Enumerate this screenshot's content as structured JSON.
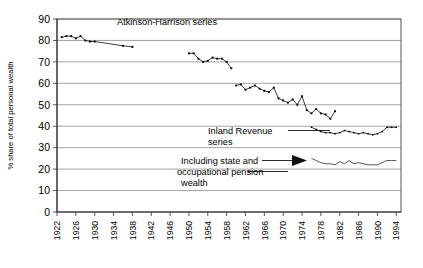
{
  "chart_data": {
    "type": "line",
    "title": "",
    "xlabel": "",
    "ylabel": "% share of total personal wealth",
    "ylim": [
      0,
      90
    ],
    "ytick_step": 10,
    "yticks": [
      0,
      10,
      20,
      30,
      40,
      50,
      60,
      70,
      80,
      90
    ],
    "xlim": [
      1922,
      1995
    ],
    "xticks": [
      1922,
      1926,
      1930,
      1934,
      1938,
      1942,
      1946,
      1950,
      1954,
      1958,
      1962,
      1966,
      1970,
      1974,
      1978,
      1982,
      1986,
      1990,
      1994
    ],
    "grid": "horizontal",
    "legend": "annotations-inline",
    "annotations": [
      {
        "name": "atkinson-harrison-label",
        "text": "Atkinson-Harrison series"
      },
      {
        "name": "inland-revenue-label-line1",
        "text": "Inland Revenue"
      },
      {
        "name": "inland-revenue-label-line2",
        "text": "series"
      },
      {
        "name": "pension-label-line1",
        "text": "Including state and"
      },
      {
        "name": "pension-label-line2",
        "text": "occupational pension"
      },
      {
        "name": "pension-label-line3",
        "text": "wealth"
      }
    ],
    "series": [
      {
        "name": "Atkinson-Harrison series",
        "marker": "square",
        "color": "#000000",
        "segments": [
          {
            "x": [
              1923,
              1924,
              1925,
              1926,
              1927,
              1928,
              1929,
              1930,
              1936,
              1938
            ],
            "values": [
              81.5,
              82.0,
              82.0,
              81.0,
              82.0,
              80.0,
              79.5,
              79.5,
              77.5,
              77.0
            ]
          },
          {
            "x": [
              1950,
              1951,
              1952,
              1953,
              1954,
              1955,
              1956,
              1957,
              1958,
              1959
            ],
            "values": [
              74.0,
              74.0,
              71.5,
              70.0,
              70.5,
              72.0,
              71.5,
              71.5,
              70.0,
              67.0
            ]
          },
          {
            "x": [
              1960,
              1961,
              1962,
              1963,
              1964,
              1965,
              1966,
              1967,
              1968,
              1969,
              1970,
              1971,
              1972,
              1973,
              1974,
              1975,
              1976,
              1977,
              1978,
              1979,
              1980,
              1981
            ],
            "values": [
              59.0,
              59.5,
              57.0,
              58.0,
              59.0,
              57.5,
              56.5,
              56.0,
              58.0,
              53.0,
              52.0,
              51.0,
              52.5,
              50.0,
              54.0,
              47.5,
              46.0,
              48.0,
              46.0,
              45.5,
              43.5,
              47.0
            ]
          }
        ]
      },
      {
        "name": "Inland Revenue series",
        "marker": "square-small",
        "color": "#000000",
        "segments": [
          {
            "x": [
              1976,
              1977,
              1978,
              1979,
              1980,
              1981,
              1982,
              1983,
              1984,
              1985,
              1986,
              1987,
              1988,
              1989,
              1990,
              1991,
              1992,
              1993,
              1994
            ],
            "values": [
              39.5,
              38.5,
              37.5,
              37.0,
              37.0,
              36.5,
              37.0,
              38.0,
              37.5,
              37.0,
              36.5,
              37.0,
              36.5,
              36.0,
              36.5,
              37.5,
              39.5,
              39.5,
              39.5
            ]
          }
        ]
      },
      {
        "name": "Including state and occupational pension wealth",
        "marker": "none",
        "color": "#2a2a2a",
        "segments": [
          {
            "x": [
              1976,
              1977,
              1978,
              1979,
              1980,
              1981,
              1982,
              1983,
              1984,
              1985,
              1986,
              1987,
              1988,
              1989,
              1990,
              1991,
              1992,
              1993,
              1994
            ],
            "values": [
              25.0,
              24.0,
              23.0,
              22.5,
              22.5,
              22.0,
              23.5,
              22.5,
              24.0,
              22.5,
              23.0,
              22.5,
              22.0,
              22.0,
              22.0,
              23.0,
              24.0,
              24.0,
              24.0
            ]
          }
        ]
      }
    ]
  }
}
